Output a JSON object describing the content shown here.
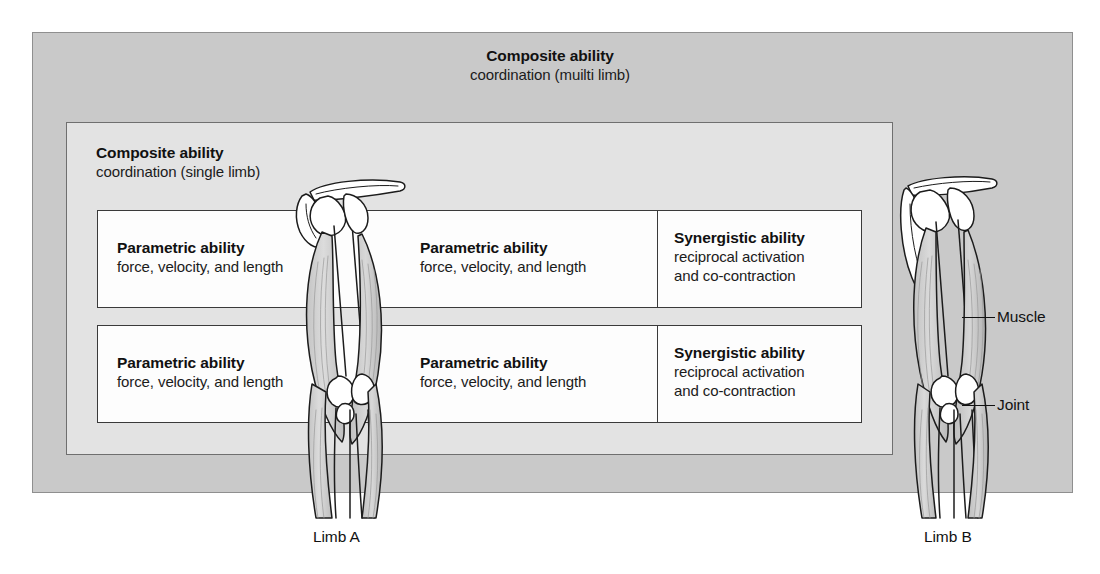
{
  "diagram": {
    "composite_multi": {
      "title": "Composite ability",
      "subtitle": "coordination (muilti limb)"
    },
    "composite_single": {
      "title": "Composite ability",
      "subtitle": "coordination (single limb)"
    },
    "rows": [
      {
        "parametric_a": {
          "title": "Parametric ability",
          "subtitle": "force, velocity, and length"
        },
        "parametric_b": {
          "title": "Parametric ability",
          "subtitle": "force, velocity, and length"
        },
        "synergistic": {
          "title": "Synergistic ability",
          "subtitle_line1": "reciprocal activation",
          "subtitle_line2": "and co-contraction"
        }
      },
      {
        "parametric_a": {
          "title": "Parametric ability",
          "subtitle": "force, velocity, and length"
        },
        "parametric_b": {
          "title": "Parametric ability",
          "subtitle": "force, velocity, and length"
        },
        "synergistic": {
          "title": "Synergistic ability",
          "subtitle_line1": "reciprocal activation",
          "subtitle_line2": "and co-contraction"
        }
      }
    ],
    "annotations": {
      "muscle": "Muscle",
      "joint": "Joint"
    },
    "limb_labels": {
      "limb_a": "Limb A",
      "limb_b": "Limb B"
    },
    "colors": {
      "outer_panel": "#c9c9c9",
      "mid_panel": "#e3e3e3",
      "box_fill": "#fdfdfd",
      "box_border": "#3a3a3a",
      "text": "#111111",
      "bone_fill": "#ffffff",
      "muscle_fill": "#cfcfcf"
    }
  }
}
